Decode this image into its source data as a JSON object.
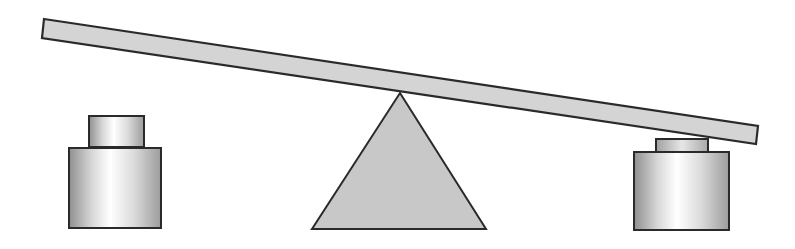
{
  "diagram": {
    "title": "Seesaw balance with weights",
    "colors": {
      "background": "#ffffff",
      "stroke": "#2a2a2a",
      "beam_fill": "#d4d4d4",
      "fulcrum_fill": "#c8c8c8",
      "weight_edge": "#9a9a9a",
      "weight_highlight": "#ffffff"
    },
    "beam": {
      "label": "beam",
      "points": "44,19 758,126 756,144 42,38"
    },
    "fulcrum": {
      "label": "fulcrum",
      "points": "400,93 486,229 312,229"
    },
    "left_weight": {
      "label": "left weight",
      "cap": {
        "x": 89,
        "y": 116,
        "w": 55,
        "h": 31
      },
      "base": {
        "x": 69,
        "y": 148,
        "w": 92,
        "h": 80
      }
    },
    "right_weight": {
      "label": "right weight",
      "cap": {
        "x": 656,
        "y": 139,
        "w": 52,
        "h": 13
      },
      "base": {
        "x": 634,
        "y": 152,
        "w": 95,
        "h": 78
      }
    }
  }
}
